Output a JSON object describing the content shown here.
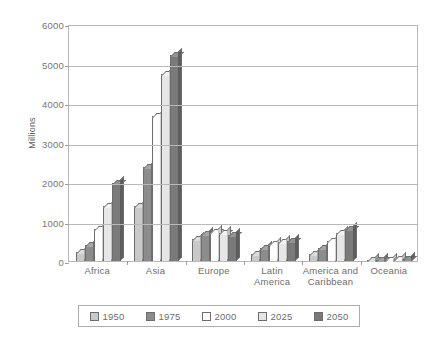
{
  "chart_data": {
    "type": "bar",
    "title": "",
    "subtitle": "",
    "xlabel": "",
    "ylabel": "Millions",
    "ylim": [
      0,
      6000
    ],
    "ytick_values": [
      0,
      1000,
      2000,
      3000,
      4000,
      5000,
      6000
    ],
    "ytick_labels": [
      "0",
      "1000",
      "2000",
      "3000",
      "4000",
      "5000",
      "6000"
    ],
    "grid": true,
    "legend_position": "bottom",
    "categories": [
      "Africa",
      "Asia",
      "Europe",
      "Latin\nAmerica",
      "America and\nCaribbean",
      "Oceania"
    ],
    "series": [
      {
        "name": "1950",
        "color": "#c9c9c9",
        "values": [
          222,
          1402,
          547,
          167,
          172,
          13
        ]
      },
      {
        "name": "1975",
        "color": "#8c8c8c",
        "values": [
          408,
          2379,
          676,
          322,
          323,
          21
        ]
      },
      {
        "name": "2000",
        "color": "#fdfdfd",
        "values": [
          800,
          3683,
          729,
          419,
          519,
          31
        ]
      },
      {
        "name": "2025",
        "color": "#e6e6e6",
        "values": [
          1400,
          4723,
          718,
          470,
          697,
          41
        ]
      },
      {
        "name": "2050",
        "color": "#7a7a7a",
        "values": [
          1980,
          5222,
          650,
          500,
          798,
          46
        ]
      }
    ]
  },
  "legend": {
    "items": [
      {
        "label": "1950",
        "swatch": "#c9c9c9"
      },
      {
        "label": "1975",
        "swatch": "#8c8c8c"
      },
      {
        "label": "2000",
        "swatch": "#fdfdfd"
      },
      {
        "label": "2025",
        "swatch": "#e6e6e6"
      },
      {
        "label": "2050",
        "swatch": "#7a7a7a"
      }
    ]
  },
  "style": {
    "axis_color": "#b9b9b9",
    "text_color": "#6e6e6e",
    "bar_outline": "#6d6d6d",
    "background": "#ffffff"
  }
}
